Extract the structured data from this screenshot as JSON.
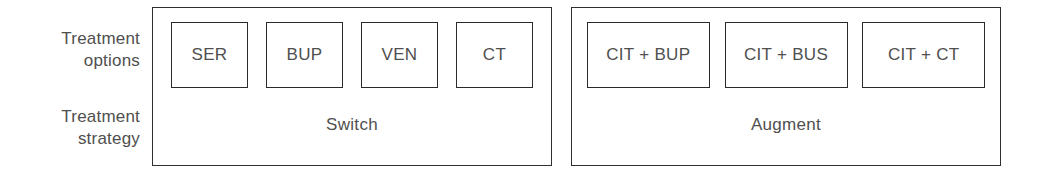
{
  "figure": {
    "row_labels": [
      {
        "id": "options",
        "text": "Treatment\noptions"
      },
      {
        "id": "strategy",
        "text": "Treatment\nstrategy"
      }
    ],
    "groups": [
      {
        "id": "switch",
        "strategy_label": "Switch",
        "options": [
          "SER",
          "BUP",
          "VEN",
          "CT"
        ]
      },
      {
        "id": "augment",
        "strategy_label": "Augment",
        "options": [
          "CIT + BUP",
          "CIT + BUS",
          "CIT + CT"
        ]
      }
    ],
    "colors": {
      "background": "#ffffff",
      "box_border": "#2b2b2b",
      "group_border": "#2f2f2f",
      "text": "#4f4f4f"
    }
  }
}
